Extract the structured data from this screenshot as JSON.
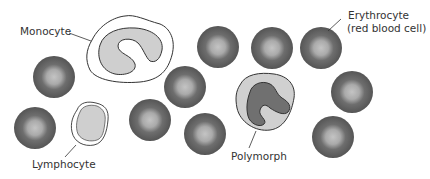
{
  "diagram": {
    "type": "blood-cells",
    "labels": {
      "monocyte": "Monocyte",
      "erythrocyte_line1": "Erythrocyte",
      "erythrocyte_line2": "(red blood cell)",
      "lymphocyte": "Lymphocyte",
      "polymorph": "Polymorph"
    },
    "colors": {
      "erythrocyte_rim": "#5a5a5a",
      "erythrocyte_center": "#b8b8b8",
      "cytoplasm": "#d2d2d2",
      "nucleus_polymorph": "#707070",
      "outline": "#333333"
    },
    "erythrocytes": [
      {
        "cx": 54,
        "cy": 77
      },
      {
        "cx": 35,
        "cy": 128
      },
      {
        "cx": 185,
        "cy": 87
      },
      {
        "cx": 150,
        "cy": 120
      },
      {
        "cx": 205,
        "cy": 134
      },
      {
        "cx": 218,
        "cy": 47
      },
      {
        "cx": 272,
        "cy": 48
      },
      {
        "cx": 321,
        "cy": 48
      },
      {
        "cx": 352,
        "cy": 92
      },
      {
        "cx": 333,
        "cy": 137
      }
    ]
  }
}
